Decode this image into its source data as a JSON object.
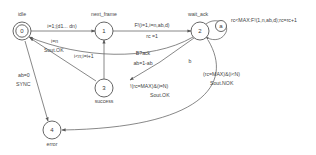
{
  "diagram": {
    "type": "state-machine",
    "title": "",
    "states": [
      {
        "id": "0",
        "name": "idle",
        "accepting": true,
        "cx": 22,
        "cy": 31
      },
      {
        "id": "1",
        "name": "next_frame",
        "accepting": false,
        "cx": 104,
        "cy": 31
      },
      {
        "id": "2",
        "name": "wait_ack",
        "accepting": false,
        "cx": 200,
        "cy": 31
      },
      {
        "id": "3",
        "name": "success",
        "accepting": false,
        "cx": 104,
        "cy": 88
      },
      {
        "id": "4",
        "name": "error",
        "accepting": false,
        "cx": 52,
        "cy": 130
      }
    ],
    "self_loops": [
      {
        "label": "a",
        "on_state": "2"
      }
    ],
    "branch_labels": [
      {
        "label": "b"
      }
    ],
    "transitions": [
      {
        "from": "0",
        "to": "1",
        "label": "i=1;(d1... dn)"
      },
      {
        "from": "1",
        "to": "2",
        "label": "F!(i=1,i=n,ab,d)\nrc =1"
      },
      {
        "from": "2",
        "to": "2",
        "label": "rc<MAX:F!(1,n,ab,d);rc=rc+1"
      },
      {
        "from": "3",
        "to": "1",
        "label": "i<n;i=i+1"
      },
      {
        "from": "2",
        "to": "3",
        "label": "B?ack\nab=1-ab"
      },
      {
        "from": "3",
        "to": "0",
        "label": "i=n\nSout.OK"
      },
      {
        "from": "2",
        "to": "0",
        "label": "!(rc=MAX)&(i=N)\nSout.OK"
      },
      {
        "from": "2",
        "to": "4",
        "label": "(rc=MAX)&(i<N)\nSout.NOK"
      },
      {
        "from": "0",
        "to": "4",
        "label": "ab=0\nSYNC"
      }
    ],
    "labels": {
      "t0_1": "i=1;(d1... dn)",
      "t1_2_line1": "F!(i=1,i=n,ab,d)",
      "t1_2_line2": "rc =1",
      "loop2": "rc<MAX:F!(1,n,ab,d);rc=rc+1",
      "loop2_name": "a",
      "t3_1": "i<n;i=i+1",
      "t2_3_line1": "B?ack",
      "t2_3_line2": "ab=1-ab",
      "branch_b": "b",
      "t3_0_line1": "i=n",
      "t3_0_line2": "Sout.OK",
      "t2_0_line1": "!(rc=MAX)&(i=N)",
      "t2_0_line2": "Sout.OK",
      "t2_4_line1": "(rc=MAX)&(i<N)",
      "t2_4_line2": "Sout.NOK",
      "t0_4_line1": "ab=0",
      "t0_4_line2": "SYNC",
      "state0_id": "0",
      "state1_id": "1",
      "state2_id": "2",
      "state3_id": "3",
      "state4_id": "4",
      "state0_name": "idle",
      "state1_name": "next_frame",
      "state2_name": "wait_ack",
      "state3_name": "success",
      "state4_name": "error"
    },
    "colors": {
      "stroke": "#555555",
      "edge": "#6a6a6a",
      "text": "#3f3f3f",
      "background": "#ffffff"
    }
  }
}
